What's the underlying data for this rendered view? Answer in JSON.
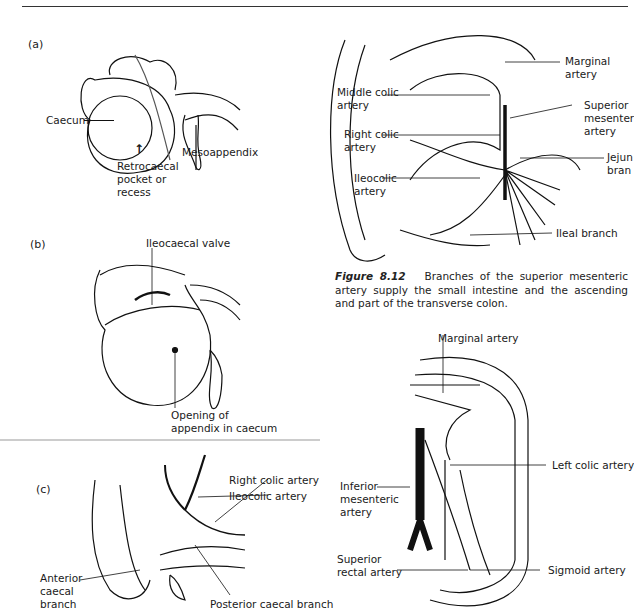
{
  "page": {
    "running_header": "96   The abdomen"
  },
  "figure_left": {
    "panels": [
      {
        "id": "a",
        "label": "(a)",
        "annotations": [
          "Caecum",
          "Retrocaecal pocket or recess",
          "Mesoappendix"
        ]
      },
      {
        "id": "b",
        "label": "(b)",
        "annotations": [
          "Ileocaecal valve",
          "Opening of appendix in caecum"
        ]
      },
      {
        "id": "c",
        "label": "(c)",
        "annotations": [
          "Right colic artery",
          "Ileocolic artery",
          "Anterior caecal branch",
          "Posterior caecal branch"
        ]
      }
    ],
    "a": {
      "label": "(a)",
      "caecum": "Caecum",
      "retro_1": "Retrocaecal",
      "retro_2": "pocket or",
      "retro_3": "recess",
      "meso": "Mesoappendix"
    },
    "b": {
      "label": "(b)",
      "valve": "Ileocaecal valve",
      "opening_1": "Opening of",
      "opening_2": "appendix in caecum"
    },
    "c": {
      "label": "(c)",
      "right_colic": "Right colic artery",
      "ileocolic": "Ileocolic artery",
      "ant_1": "Anterior",
      "ant_2": "caecal",
      "ant_3": "branch",
      "post": "Posterior caecal branch"
    }
  },
  "figure_8_12": {
    "labels": {
      "marginal_1": "Marginal",
      "marginal_2": "artery",
      "middle_colic_1": "Middle colic",
      "middle_colic_2": "artery",
      "sma_1": "Superior",
      "sma_2": "mesenter",
      "sma_3": "artery",
      "right_colic_1": "Right colic",
      "right_colic_2": "artery",
      "jejunal_1": "Jejun",
      "jejunal_2": "bran",
      "ileocolic_1": "Ileocolic",
      "ileocolic_2": "artery",
      "ileal": "Ileal branch"
    },
    "caption_number": "Figure 8.12",
    "caption_text": "Branches of the superior mesenteric artery supply the small intestine and the ascending and part of the transverse colon."
  },
  "figure_ima": {
    "labels": {
      "marginal": "Marginal artery",
      "left_colic": "Left colic artery",
      "ima_1": "Inferior",
      "ima_2": "mesenteric",
      "ima_3": "artery",
      "sup_rectal_1": "Superior",
      "sup_rectal_2": "rectal artery",
      "sigmoid": "Sigmoid artery"
    }
  }
}
